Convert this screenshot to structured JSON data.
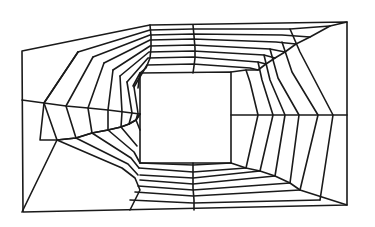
{
  "diagram": {
    "title": "",
    "type": "structured-quadrilateral-mesh",
    "stroke_color": "#1a1a1a",
    "background": "#ffffff",
    "outer_boundary": [
      [
        22,
        51
      ],
      [
        150,
        25
      ],
      [
        347,
        22
      ],
      [
        347,
        205
      ],
      [
        23,
        212
      ]
    ],
    "inner_hole": [
      [
        140,
        73
      ],
      [
        231,
        72
      ],
      [
        231,
        163
      ],
      [
        140,
        163
      ]
    ],
    "ring_polylines": [
      [
        [
          42,
          49
        ],
        [
          150,
          30
        ],
        [
          260,
          30
        ],
        [
          330,
          27
        ]
      ],
      [
        [
          78,
          42
        ],
        [
          148,
          35
        ],
        [
          250,
          36
        ],
        [
          296,
          43
        ]
      ],
      [
        [
          93,
          55
        ],
        [
          149,
          40
        ],
        [
          240,
          40
        ],
        [
          283,
          46
        ]
      ],
      [
        [
          105,
          63
        ],
        [
          148,
          45
        ],
        [
          236,
          45
        ],
        [
          276,
          51
        ]
      ],
      [
        [
          113,
          69
        ],
        [
          147,
          50
        ],
        [
          234,
          50
        ],
        [
          268,
          56
        ]
      ],
      [
        [
          119,
          73
        ],
        [
          146,
          56
        ],
        [
          233,
          56
        ],
        [
          259,
          61
        ]
      ],
      [
        [
          126,
          78
        ],
        [
          144,
          63
        ],
        [
          232,
          64
        ],
        [
          248,
          66
        ]
      ],
      [
        [
          133,
          84
        ],
        [
          140,
          73
        ]
      ],
      [
        [
          31,
          61
        ],
        [
          22,
          51
        ]
      ]
    ],
    "sections": {
      "top": {
        "rings": [
          [
            [
              22,
              51
            ],
            [
              150,
              25
            ],
            [
              347,
              22
            ]
          ],
          [
            [
              78,
              52
            ],
            [
              148,
              31
            ],
            [
              242,
              32
            ],
            [
              330,
              27
            ]
          ],
          [
            [
              94,
              58
            ],
            [
              148,
              36
            ],
            [
              236,
              37
            ],
            [
              301,
              45
            ]
          ],
          [
            [
              104,
              66
            ],
            [
              148,
              42
            ],
            [
              234,
              42
            ],
            [
              285,
              51
            ]
          ],
          [
            [
              113,
              71
            ],
            [
              147,
              47
            ],
            [
              233,
              47
            ],
            [
              272,
              56
            ]
          ],
          [
            [
              121,
              78
            ],
            [
              147,
              53
            ],
            [
              232,
              53
            ],
            [
              263,
              61
            ]
          ],
          [
            [
              128,
              84
            ],
            [
              146,
              61
            ],
            [
              232,
              61
            ],
            [
              251,
              68
            ]
          ],
          [
            [
              140,
              91
            ],
            [
              140,
              73
            ],
            [
              231,
              72
            ],
            [
              231,
              72
            ]
          ]
        ],
        "mid_spoke": [
          [
            150,
            25
          ],
          [
            151,
            34
          ],
          [
            151,
            44
          ],
          [
            151,
            55
          ],
          [
            150,
            64
          ],
          [
            150,
            73
          ]
        ],
        "mid_spoke_2": [
          [
            193,
            25
          ],
          [
            194,
            35
          ],
          [
            195,
            45
          ],
          [
            195,
            55
          ],
          [
            194,
            65
          ],
          [
            193,
            73
          ]
        ]
      }
    },
    "middle_line_left": [
      [
        22,
        100
      ],
      [
        44,
        103
      ],
      [
        66,
        106
      ],
      [
        88,
        108
      ],
      [
        108,
        110
      ],
      [
        124,
        112
      ],
      [
        140,
        114
      ]
    ],
    "middle_line_right": [
      [
        231,
        115
      ],
      [
        258,
        115
      ],
      [
        273,
        115
      ],
      [
        285,
        115
      ],
      [
        299,
        115
      ],
      [
        318,
        115
      ],
      [
        347,
        115
      ]
    ],
    "bottom_mid_spoke": [
      [
        193,
        163
      ],
      [
        193,
        175
      ],
      [
        193,
        185
      ],
      [
        193,
        195
      ],
      [
        193,
        205
      ]
    ],
    "left_spokes": [
      [
        [
          78,
          52
        ],
        [
          44,
          103
        ],
        [
          57,
          140
        ],
        [
          22,
          212
        ]
      ],
      [
        [
          94,
          58
        ],
        [
          66,
          106
        ],
        [
          76,
          137
        ],
        [
          63,
          160
        ]
      ],
      [
        [
          104,
          66
        ],
        [
          88,
          108
        ],
        [
          92,
          133
        ],
        [
          94,
          155
        ]
      ],
      [
        [
          113,
          71
        ],
        [
          108,
          110
        ],
        [
          108,
          130
        ],
        [
          114,
          150
        ]
      ],
      [
        [
          121,
          78
        ],
        [
          124,
          112
        ],
        [
          121,
          128
        ],
        [
          126,
          145
        ]
      ],
      [
        [
          128,
          84
        ],
        [
          134,
          113
        ],
        [
          129,
          126
        ],
        [
          136,
          140
        ]
      ]
    ]
  }
}
